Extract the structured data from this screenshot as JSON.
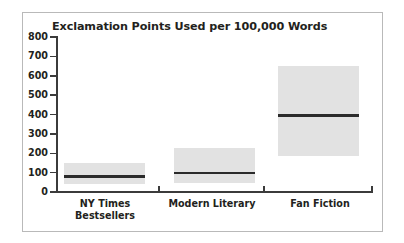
{
  "chart_data": {
    "type": "bar",
    "title": "Exclamation Points Used per 100,000 Words",
    "xlabel": "",
    "ylabel": "",
    "ylim": [
      0,
      800
    ],
    "yticks": [
      0,
      100,
      200,
      300,
      400,
      500,
      600,
      700,
      800
    ],
    "ytick_labels": [
      "0",
      "100",
      "200",
      "300",
      "400",
      "500",
      "600",
      "700",
      "800"
    ],
    "grid": false,
    "legend": "none",
    "categories": [
      "NY Times Bestsellers",
      "Modern Literary",
      "Fan Fiction"
    ],
    "category_label_lines": [
      [
        "NY Times",
        "Bestsellers"
      ],
      [
        "Modern Literary",
        ""
      ],
      [
        "Fan Fiction",
        ""
      ]
    ],
    "boxes": [
      {
        "category": "NY Times Bestsellers",
        "low": 40,
        "high": 150,
        "median": 80
      },
      {
        "category": "Modern Literary",
        "low": 45,
        "high": 225,
        "median": 100
      },
      {
        "category": "Fan Fiction",
        "low": 185,
        "high": 650,
        "median": 395
      }
    ],
    "colors": {
      "box_fill": "#e2e2e2",
      "median_line": "#2b2b2b",
      "axis": "#3b3b3b",
      "text": "#231f20",
      "frame_border": "#b9b9b9",
      "background": "#ffffff"
    }
  }
}
